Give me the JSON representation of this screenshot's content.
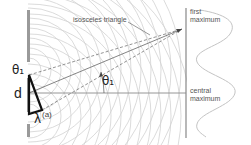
{
  "diagram": {
    "type": "double-slit interference",
    "labels": {
      "isosceles": "isosceles triangle",
      "first_max_line1": "first",
      "first_max_line2": "maximum",
      "central_max_line1": "central",
      "central_max_line2": "maximum",
      "theta_left": "θ₁",
      "theta_right": "θ₁",
      "d": "d",
      "lambda": "λ",
      "a": "(a)"
    },
    "colors": {
      "barrier": "#999999",
      "screen": "#888888",
      "wavefront": "#cccccc",
      "triangle": "#111111",
      "dashed": "#777777",
      "axis": "#888888",
      "intensity": "#bbbbbb"
    }
  }
}
